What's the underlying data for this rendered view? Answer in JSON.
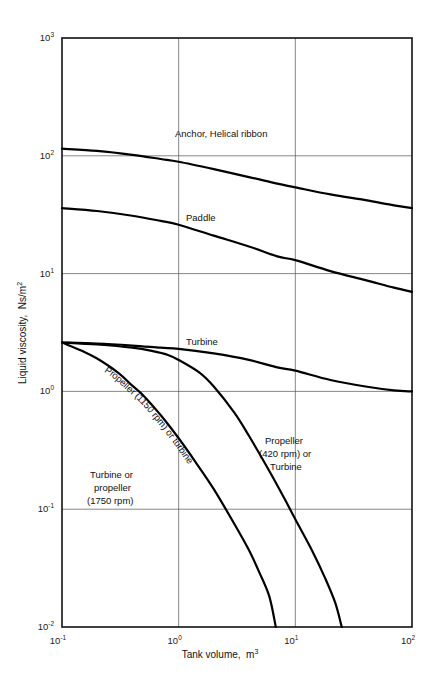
{
  "chart_data": {
    "type": "line",
    "title": "",
    "xlabel": "Tank volume,  m3",
    "xlabel_base": "Tank volume,  m",
    "xlabel_exp": "3",
    "ylabel": "Liquid viscosity,  Ns/m2",
    "ylabel_base": "Liquid viscosity,  Ns/m",
    "ylabel_exp": "2",
    "xscale": "log",
    "yscale": "log",
    "xlim": [
      0.1,
      100
    ],
    "ylim": [
      0.01,
      1000
    ],
    "grid": true,
    "legend_position": "inline-annotations",
    "xticks": [
      {
        "value": 0.1,
        "base": "10",
        "exp": "-1"
      },
      {
        "value": 1,
        "base": "10",
        "exp": "0"
      },
      {
        "value": 10,
        "base": "10",
        "exp": "1"
      },
      {
        "value": 100,
        "base": "10",
        "exp": "2"
      }
    ],
    "yticks": [
      {
        "value": 1000,
        "base": "10",
        "exp": "3"
      },
      {
        "value": 100,
        "base": "10",
        "exp": "2"
      },
      {
        "value": 10,
        "base": "10",
        "exp": "1"
      },
      {
        "value": 1,
        "base": "10",
        "exp": "0"
      },
      {
        "value": 0.1,
        "base": "10",
        "exp": "-1"
      },
      {
        "value": 0.01,
        "base": "10",
        "exp": "-2"
      }
    ],
    "series": [
      {
        "name": "Anchor, Helical ribbon",
        "points": [
          [
            0.1,
            115
          ],
          [
            0.2,
            110
          ],
          [
            0.4,
            102
          ],
          [
            0.7,
            94
          ],
          [
            1.0,
            89
          ],
          [
            2.0,
            77
          ],
          [
            4.0,
            66
          ],
          [
            7.0,
            58
          ],
          [
            10,
            54
          ],
          [
            20,
            47
          ],
          [
            40,
            42
          ],
          [
            70,
            38
          ],
          [
            100,
            36
          ]
        ]
      },
      {
        "name": "Paddle",
        "points": [
          [
            0.1,
            36
          ],
          [
            0.2,
            34
          ],
          [
            0.4,
            31
          ],
          [
            0.7,
            28
          ],
          [
            1.0,
            26
          ],
          [
            2.0,
            21
          ],
          [
            4.0,
            17
          ],
          [
            7.0,
            14
          ],
          [
            10,
            13
          ],
          [
            20,
            10.5
          ],
          [
            40,
            8.8
          ],
          [
            70,
            7.6
          ],
          [
            100,
            7.0
          ]
        ]
      },
      {
        "name": "Turbine",
        "points": [
          [
            0.1,
            2.6
          ],
          [
            0.2,
            2.55
          ],
          [
            0.4,
            2.45
          ],
          [
            0.7,
            2.35
          ],
          [
            1.0,
            2.3
          ],
          [
            2.0,
            2.1
          ],
          [
            4.0,
            1.85
          ],
          [
            7.0,
            1.6
          ],
          [
            10,
            1.5
          ],
          [
            20,
            1.25
          ],
          [
            40,
            1.1
          ],
          [
            70,
            1.02
          ],
          [
            100,
            1.0
          ]
        ]
      },
      {
        "name": "Propeller (420 rpm) or Turbine",
        "points": [
          [
            0.1,
            2.6
          ],
          [
            0.2,
            2.5
          ],
          [
            0.4,
            2.35
          ],
          [
            0.6,
            2.2
          ],
          [
            0.8,
            2.05
          ],
          [
            1.0,
            1.85
          ],
          [
            1.5,
            1.45
          ],
          [
            2.0,
            1.1
          ],
          [
            3.0,
            0.66
          ],
          [
            4.0,
            0.42
          ],
          [
            6.0,
            0.21
          ],
          [
            8.0,
            0.125
          ],
          [
            10,
            0.082
          ],
          [
            14,
            0.044
          ],
          [
            18,
            0.026
          ],
          [
            22,
            0.016
          ],
          [
            25,
            0.01
          ]
        ]
      },
      {
        "name": "Propeller (1150 rpm) or turbine",
        "points": [
          [
            0.1,
            2.6
          ],
          [
            0.15,
            2.2
          ],
          [
            0.2,
            1.9
          ],
          [
            0.3,
            1.45
          ],
          [
            0.4,
            1.12
          ],
          [
            0.5,
            0.92
          ],
          [
            0.7,
            0.63
          ],
          [
            1.0,
            0.4
          ],
          [
            1.4,
            0.25
          ],
          [
            2.0,
            0.148
          ],
          [
            3.0,
            0.075
          ],
          [
            4.0,
            0.045
          ],
          [
            5.0,
            0.028
          ],
          [
            6.0,
            0.018
          ],
          [
            6.8,
            0.01
          ]
        ]
      }
    ],
    "annotations": [
      {
        "id": "anchor-label",
        "text": "Anchor, Helical ribbon",
        "x": 175,
        "y": 137,
        "rotation": 0
      },
      {
        "id": "paddle-label",
        "text": "Paddle",
        "x": 186,
        "y": 221,
        "rotation": 0
      },
      {
        "id": "turbine-label",
        "text": "Turbine",
        "x": 186,
        "y": 345,
        "rotation": 0
      },
      {
        "id": "propeller-1150-label",
        "text": "Propeller (1150 rpm) or turbine",
        "x": 0,
        "y": 0,
        "rotation": 56
      },
      {
        "id": "propeller-420-line1",
        "text": "Propeller",
        "x": 265,
        "y": 444,
        "rotation": 0
      },
      {
        "id": "propeller-420-line2",
        "text": "(420 rpm) or",
        "x": 259,
        "y": 457,
        "rotation": 0
      },
      {
        "id": "propeller-420-line3",
        "text": "Turbine",
        "x": 270,
        "y": 470,
        "rotation": 0
      },
      {
        "id": "turbine-1750-line1",
        "text": "Turbine or",
        "x": 90,
        "y": 478,
        "rotation": 0
      },
      {
        "id": "turbine-1750-line2",
        "text": "propeller",
        "x": 94,
        "y": 491,
        "rotation": 0
      },
      {
        "id": "turbine-1750-line3",
        "text": "(1750 rpm)",
        "x": 87,
        "y": 504,
        "rotation": 0
      }
    ]
  },
  "caption": {
    "text": ""
  }
}
